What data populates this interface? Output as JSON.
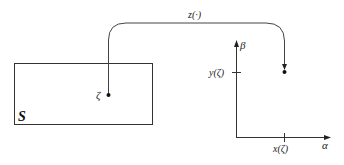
{
  "diagram": {
    "set": {
      "label": "S",
      "point_label": "ζ"
    },
    "mapping": {
      "label": "z(·)"
    },
    "axes": {
      "vertical_label": "β",
      "horizontal_label": "α",
      "y_tick_label": "y(ζ)",
      "x_tick_label": "x(ζ)"
    },
    "colors": {
      "stroke": "#333333",
      "text": "#222222",
      "background": "#ffffff"
    }
  }
}
